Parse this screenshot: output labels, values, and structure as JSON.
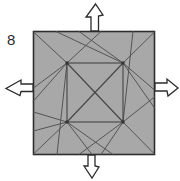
{
  "diagram": {
    "step_label": "8",
    "colors": {
      "paper_fill": "#a8a8a8",
      "paper_stroke": "#2e2e2e",
      "crease_stroke": "#555555",
      "arrow_fill": "#ffffff",
      "arrow_stroke": "#2b2b2b",
      "background": "#ffffff",
      "label_color": "#2b2b2b"
    },
    "outer_square": {
      "label": "paper-outline",
      "x": 33,
      "y": 31,
      "width": 122,
      "height": 124
    },
    "inner_square": {
      "label": "inner-square-crease",
      "x": 67,
      "y": 63,
      "width": 56,
      "height": 59
    },
    "inner_vertices": [
      {
        "name": "inner-top-left",
        "x": 67,
        "y": 63
      },
      {
        "name": "inner-top-right",
        "x": 123,
        "y": 63
      },
      {
        "name": "inner-bottom-right",
        "x": 123,
        "y": 122
      },
      {
        "name": "inner-bottom-left",
        "x": 67,
        "y": 122
      }
    ],
    "inner_diagonals": [
      {
        "name": "diagonal-tl-br",
        "x1": 67,
        "y1": 63,
        "x2": 123,
        "y2": 122
      },
      {
        "name": "diagonal-tr-bl",
        "x1": 123,
        "y1": 63,
        "x2": 67,
        "y2": 122
      }
    ],
    "crease_lines": [
      {
        "name": "crease-tl-corner",
        "x1": 67,
        "y1": 63,
        "x2": 33,
        "y2": 31
      },
      {
        "name": "crease-tl-to-top",
        "x1": 67,
        "y1": 63,
        "x2": 101,
        "y2": 31
      },
      {
        "name": "crease-tl-to-left",
        "x1": 67,
        "y1": 63,
        "x2": 33,
        "y2": 88
      },
      {
        "name": "crease-tl-to-leftlow",
        "x1": 67,
        "y1": 63,
        "x2": 33,
        "y2": 100
      },
      {
        "name": "crease-tl-to-bottomedge",
        "x1": 67,
        "y1": 63,
        "x2": 57,
        "y2": 155
      },
      {
        "name": "crease-tr-corner",
        "x1": 123,
        "y1": 63,
        "x2": 155,
        "y2": 31
      },
      {
        "name": "crease-tr-to-topleft",
        "x1": 123,
        "y1": 63,
        "x2": 78,
        "y2": 31
      },
      {
        "name": "crease-tr-to-topfar",
        "x1": 123,
        "y1": 63,
        "x2": 55,
        "y2": 31
      },
      {
        "name": "crease-tr-to-right",
        "x1": 123,
        "y1": 63,
        "x2": 155,
        "y2": 90
      },
      {
        "name": "crease-tr-to-rightlow",
        "x1": 123,
        "y1": 63,
        "x2": 155,
        "y2": 108
      },
      {
        "name": "crease-br-corner",
        "x1": 123,
        "y1": 122,
        "x2": 155,
        "y2": 155
      },
      {
        "name": "crease-br-to-right",
        "x1": 123,
        "y1": 122,
        "x2": 155,
        "y2": 97
      },
      {
        "name": "crease-br-to-bottom",
        "x1": 123,
        "y1": 122,
        "x2": 100,
        "y2": 155
      },
      {
        "name": "crease-br-to-bottomfar",
        "x1": 123,
        "y1": 122,
        "x2": 78,
        "y2": 155
      },
      {
        "name": "crease-br-to-topedge",
        "x1": 123,
        "y1": 122,
        "x2": 133,
        "y2": 31
      },
      {
        "name": "crease-bl-corner",
        "x1": 67,
        "y1": 122,
        "x2": 33,
        "y2": 155
      },
      {
        "name": "crease-bl-to-left",
        "x1": 67,
        "y1": 122,
        "x2": 33,
        "y2": 113
      },
      {
        "name": "crease-bl-to-leftup",
        "x1": 67,
        "y1": 122,
        "x2": 33,
        "y2": 130
      },
      {
        "name": "crease-bl-to-bottom",
        "x1": 67,
        "y1": 122,
        "x2": 92,
        "y2": 155
      },
      {
        "name": "crease-bl-to-bottomfar",
        "x1": 67,
        "y1": 122,
        "x2": 112,
        "y2": 155
      }
    ],
    "arrows": [
      {
        "name": "arrow-up",
        "direction": "up",
        "meaning": "pull-outward"
      },
      {
        "name": "arrow-down",
        "direction": "down",
        "meaning": "pull-outward"
      },
      {
        "name": "arrow-left",
        "direction": "left",
        "meaning": "pull-outward"
      },
      {
        "name": "arrow-right",
        "direction": "right",
        "meaning": "pull-outward"
      }
    ]
  }
}
